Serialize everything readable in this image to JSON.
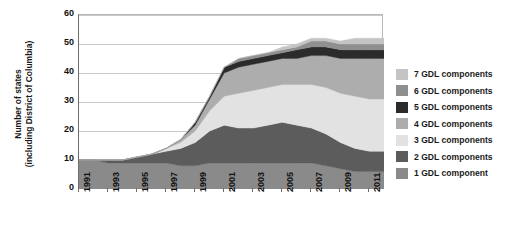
{
  "chart_data": {
    "type": "area",
    "title": "",
    "subtitle": "",
    "xlabel": "",
    "ylabel": "Number of states\n(including District of Columbia)",
    "stacked": true,
    "grid": true,
    "legend_position": "right",
    "xlim": [
      1991,
      2012
    ],
    "ylim": [
      0,
      60
    ],
    "yticks": [
      0,
      10,
      20,
      30,
      40,
      50,
      60
    ],
    "xticks": [
      1991,
      1993,
      1995,
      1997,
      1999,
      2001,
      2003,
      2005,
      2007,
      2009,
      2011
    ],
    "x": [
      1991,
      1992,
      1993,
      1994,
      1995,
      1996,
      1997,
      1998,
      1999,
      2000,
      2001,
      2002,
      2003,
      2004,
      2005,
      2006,
      2007,
      2008,
      2009,
      2010,
      2011,
      2012
    ],
    "series": [
      {
        "name": "1 GDL component",
        "color": "#8a8a8a",
        "values": [
          10,
          10,
          9,
          9,
          9,
          9,
          9,
          8,
          8,
          9,
          9,
          9,
          9,
          9,
          9,
          9,
          9,
          8,
          7,
          6,
          6,
          6
        ]
      },
      {
        "name": "2 GDL components",
        "color": "#5c5c5c",
        "values": [
          0,
          0,
          1,
          1,
          2,
          3,
          4,
          6,
          8,
          11,
          13,
          12,
          12,
          13,
          14,
          13,
          12,
          11,
          9,
          8,
          7,
          7
        ]
      },
      {
        "name": "3 GDL components",
        "color": "#e2e2e2",
        "values": [
          0,
          0,
          0,
          0,
          0,
          0,
          1,
          2,
          4,
          7,
          10,
          12,
          13,
          13,
          13,
          14,
          15,
          16,
          17,
          18,
          18,
          18
        ]
      },
      {
        "name": "4 GDL components",
        "color": "#adadad",
        "values": [
          0,
          0,
          0,
          0,
          0,
          0,
          0,
          1,
          2,
          4,
          8,
          9,
          9,
          9,
          9,
          9,
          10,
          11,
          12,
          13,
          14,
          14
        ]
      },
      {
        "name": "5 GDL components",
        "color": "#2b2b2b",
        "values": [
          0,
          0,
          0,
          0,
          0,
          0,
          0,
          0,
          1,
          1,
          2,
          2,
          2,
          2,
          2,
          3,
          3,
          3,
          3,
          3,
          3,
          3
        ]
      },
      {
        "name": "6 GDL components",
        "color": "#8f8f8f",
        "values": [
          0,
          0,
          0,
          0,
          0,
          0,
          0,
          0,
          0,
          0,
          0,
          1,
          1,
          1,
          1,
          1,
          2,
          2,
          2,
          2,
          2,
          2
        ]
      },
      {
        "name": "7 GDL components",
        "color": "#c4c4c4",
        "values": [
          0,
          0,
          0,
          0,
          0,
          0,
          0,
          0,
          0,
          0,
          0,
          0,
          0,
          0,
          1,
          1,
          1,
          1,
          1,
          2,
          2,
          2
        ]
      }
    ]
  },
  "legend": {
    "items": [
      {
        "label": "7 GDL components",
        "color": "#c4c4c4"
      },
      {
        "label": "6 GDL components",
        "color": "#8f8f8f"
      },
      {
        "label": "5 GDL components",
        "color": "#2b2b2b"
      },
      {
        "label": "4 GDL components",
        "color": "#adadad"
      },
      {
        "label": "3 GDL components",
        "color": "#e2e2e2"
      },
      {
        "label": "2 GDL components",
        "color": "#5c5c5c"
      },
      {
        "label": "1 GDL component",
        "color": "#8a8a8a"
      }
    ]
  }
}
